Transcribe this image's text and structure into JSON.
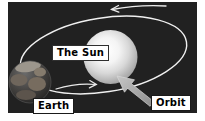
{
  "labels": {
    "sun": "The Sun",
    "earth": "Earth",
    "orbit": "Orbit"
  },
  "colors": {
    "space_background": "#212121",
    "orbit_line": "#f0f0f0",
    "sun_core": "#ffffff",
    "sun_edge": "#9a9a9a",
    "pointer_arrow": "#a6a6a6",
    "label_background": "#ffffff",
    "label_text": "#000000"
  }
}
